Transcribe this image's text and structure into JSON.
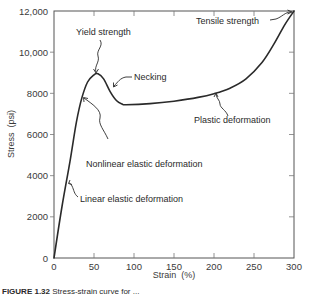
{
  "chart_data": {
    "type": "line",
    "title": "",
    "xlabel": "Strain (%)",
    "ylabel": "Stress (psi)",
    "xlim": [
      0,
      300
    ],
    "ylim": [
      0,
      12000
    ],
    "x_ticks": [
      0,
      50,
      100,
      150,
      200,
      250,
      300
    ],
    "x_tick_labels": [
      "0",
      "50",
      "100",
      "150",
      "200",
      "250",
      "300"
    ],
    "y_ticks": [
      0,
      2000,
      4000,
      6000,
      8000,
      10000,
      12000
    ],
    "y_tick_labels": [
      "0",
      "2000",
      "4000",
      "6000",
      "8000",
      "10,000",
      "12,000"
    ],
    "grid": false,
    "legend": null,
    "series": [
      {
        "name": "Stress-strain curve",
        "color": "#2a2a2a",
        "x": [
          0,
          10,
          20,
          28,
          35,
          42,
          50,
          55,
          62,
          70,
          78,
          85,
          90,
          120,
          150,
          180,
          200,
          220,
          240,
          260,
          275,
          288,
          300
        ],
        "y": [
          0,
          2500,
          4700,
          6600,
          7800,
          8550,
          8900,
          8950,
          8700,
          8100,
          7650,
          7480,
          7450,
          7500,
          7620,
          7800,
          7980,
          8250,
          8700,
          9500,
          10400,
          11300,
          12000
        ]
      }
    ],
    "annotations": [
      {
        "text": "Yield strength",
        "x": 54,
        "y": 8950
      },
      {
        "text": "Necking",
        "x": 70,
        "y": 8200
      },
      {
        "text": "Tensile strength",
        "x": 300,
        "y": 12000
      },
      {
        "text": "Plastic deformation",
        "x": 205,
        "y": 8050
      },
      {
        "text": "Nonlinear elastic deformation",
        "x": 32,
        "y": 7500
      },
      {
        "text": "Linear elastic deformation",
        "x": 18,
        "y": 4100
      }
    ]
  },
  "labels": {
    "y_axis_title": "Stress  (psi)",
    "x_axis_title": "Strain  (%)",
    "yield": "Yield strength",
    "necking": "Necking",
    "tensile": "Tensile strength",
    "plastic": "Plastic deformation",
    "nonlinear": "Nonlinear elastic deformation",
    "linear": "Linear elastic deformation"
  },
  "caption": {
    "figure_number": "FIGURE 1.32",
    "text": "Stress-strain curve for ..."
  }
}
